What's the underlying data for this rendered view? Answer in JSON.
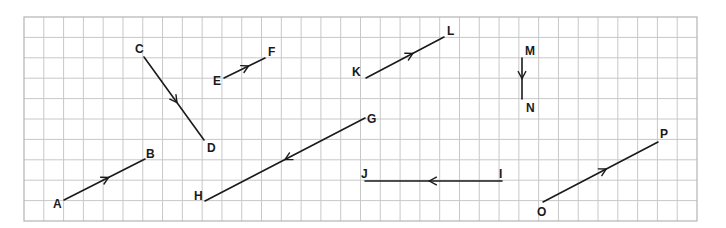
{
  "diagram": {
    "type": "vectors-on-grid",
    "grid": {
      "left": 24,
      "top": 17,
      "right": 697,
      "bottom": 221,
      "columns": 34,
      "rows": 10,
      "line_color": "#c8c8c8",
      "border_color": "#b4b4b4"
    },
    "ink_color": "#1a1a1a",
    "vectors": [
      {
        "id": "AB",
        "from": "A",
        "to": "B",
        "x1": 64,
        "y1": 200,
        "x2": 145,
        "y2": 159,
        "arrow_at": 0.55,
        "labels": [
          {
            "text": "A",
            "x": 53,
            "y": 208
          },
          {
            "text": "B",
            "x": 146,
            "y": 158
          }
        ]
      },
      {
        "id": "CD",
        "from": "C",
        "to": "D",
        "x1": 144,
        "y1": 57,
        "x2": 204,
        "y2": 140,
        "arrow_at": 0.55,
        "labels": [
          {
            "text": "C",
            "x": 135,
            "y": 53
          },
          {
            "text": "D",
            "x": 207,
            "y": 152
          }
        ]
      },
      {
        "id": "EF",
        "from": "E",
        "to": "F",
        "x1": 224,
        "y1": 78,
        "x2": 265,
        "y2": 58,
        "arrow_at": 0.6,
        "labels": [
          {
            "text": "E",
            "x": 213,
            "y": 85
          },
          {
            "text": "F",
            "x": 268,
            "y": 56
          }
        ]
      },
      {
        "id": "GH",
        "from": "G",
        "to": "H",
        "x1": 365,
        "y1": 118,
        "x2": 205,
        "y2": 201,
        "arrow_at": 0.5,
        "labels": [
          {
            "text": "G",
            "x": 367,
            "y": 123
          },
          {
            "text": "H",
            "x": 194,
            "y": 200
          }
        ]
      },
      {
        "id": "IJ",
        "from": "I",
        "to": "J",
        "x1": 502,
        "y1": 181,
        "x2": 365,
        "y2": 181,
        "arrow_at": 0.53,
        "labels": [
          {
            "text": "I",
            "x": 499,
            "y": 178
          },
          {
            "text": "J",
            "x": 361,
            "y": 178
          }
        ]
      },
      {
        "id": "KL",
        "from": "K",
        "to": "L",
        "x1": 366,
        "y1": 78,
        "x2": 444,
        "y2": 37,
        "arrow_at": 0.6,
        "labels": [
          {
            "text": "K",
            "x": 352,
            "y": 76
          },
          {
            "text": "L",
            "x": 447,
            "y": 35
          }
        ]
      },
      {
        "id": "MN",
        "from": "M",
        "to": "N",
        "x1": 522,
        "y1": 58,
        "x2": 522,
        "y2": 99,
        "arrow_at": 0.5,
        "labels": [
          {
            "text": "M",
            "x": 525,
            "y": 55
          },
          {
            "text": "N",
            "x": 526,
            "y": 112
          }
        ]
      },
      {
        "id": "OP",
        "from": "O",
        "to": "P",
        "x1": 543,
        "y1": 202,
        "x2": 658,
        "y2": 142,
        "arrow_at": 0.55,
        "labels": [
          {
            "text": "O",
            "x": 537,
            "y": 216
          },
          {
            "text": "P",
            "x": 660,
            "y": 138
          }
        ]
      }
    ]
  }
}
